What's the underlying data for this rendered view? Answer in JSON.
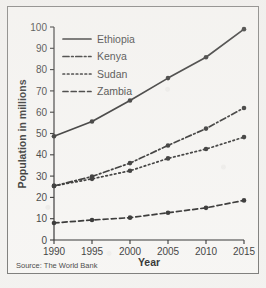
{
  "figure": {
    "source_note": "Source: The World Bank",
    "frame_color": "#6a6a68",
    "ink_color": "#111111",
    "background_color": "#f7f6f4"
  },
  "chart_data": {
    "type": "line",
    "title": "",
    "xlabel": "Year",
    "ylabel": "Population in millions",
    "categories": [
      "1990",
      "1995",
      "2000",
      "2005",
      "2010",
      "2015"
    ],
    "x": [
      1990,
      1995,
      2000,
      2005,
      2010,
      2015
    ],
    "xlim": [
      1990,
      2015
    ],
    "ylim": [
      0,
      100
    ],
    "yticks": [
      0,
      10,
      20,
      30,
      40,
      50,
      60,
      70,
      80,
      90,
      100
    ],
    "xticks": [
      1990,
      1995,
      2000,
      2005,
      2010,
      2015
    ],
    "grid": false,
    "legend_position": "top-left",
    "markers": "filled-circle",
    "series": [
      {
        "name": "Ethiopia",
        "line_style": "solid",
        "values": [
          48.7,
          55.6,
          65.5,
          76.0,
          85.8,
          99.0
        ]
      },
      {
        "name": "Kenya",
        "line_style": "dash-dot",
        "values": [
          25.4,
          29.8,
          36.1,
          44.4,
          52.3,
          62.0
        ]
      },
      {
        "name": "Sudan",
        "line_style": "dotted",
        "values": [
          25.4,
          28.7,
          32.5,
          38.3,
          42.7,
          48.3
        ]
      },
      {
        "name": "Zambia",
        "line_style": "dashed",
        "values": [
          8.0,
          9.4,
          10.5,
          12.8,
          15.1,
          18.6
        ]
      }
    ]
  }
}
